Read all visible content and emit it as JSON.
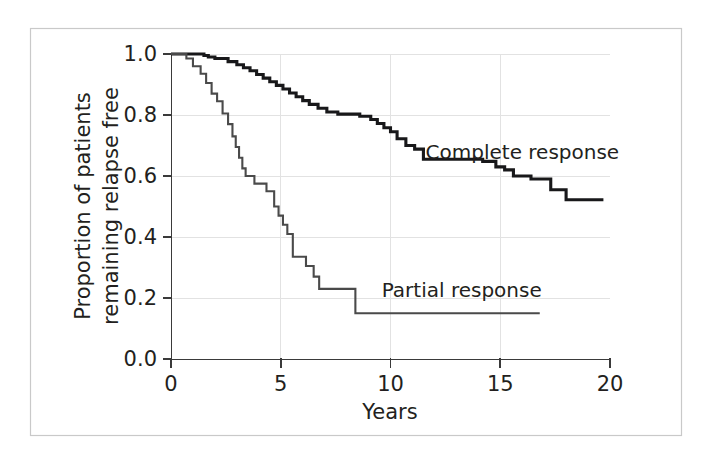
{
  "chart_data": {
    "type": "line",
    "title": "",
    "subtitle": "",
    "xlabel": "Years",
    "ylabel": "Proportion of patients remaining relapse free",
    "ylabel_line1": "Proportion of patients",
    "ylabel_line2": "remaining relapse free",
    "xlim": [
      0,
      20
    ],
    "ylim": [
      0.0,
      1.0
    ],
    "xticks": [
      0,
      5,
      10,
      15,
      20
    ],
    "xticklabels": [
      "0",
      "5",
      "10",
      "15",
      "20"
    ],
    "yticks": [
      0.0,
      0.2,
      0.4,
      0.6,
      0.8,
      1.0
    ],
    "yticklabels": [
      "0.0",
      "0.2",
      "0.4",
      "0.6",
      "0.8",
      "1.0"
    ],
    "grid": true,
    "grid_color": "#e2e2e2",
    "legend_position": "inline-annotations",
    "plot_style": "kaplan-meier step curves",
    "series": [
      {
        "name": "Complete response",
        "label": "Complete response",
        "color": "#18181a",
        "line_width": 3.1,
        "label_x": 11.6,
        "label_y": 0.655,
        "points": [
          [
            0.0,
            1.0
          ],
          [
            1.5,
            1.0
          ],
          [
            1.5,
            0.995
          ],
          [
            1.7,
            0.995
          ],
          [
            1.7,
            0.99
          ],
          [
            2.0,
            0.99
          ],
          [
            2.0,
            0.985
          ],
          [
            2.6,
            0.985
          ],
          [
            2.6,
            0.975
          ],
          [
            3.0,
            0.975
          ],
          [
            3.0,
            0.965
          ],
          [
            3.3,
            0.965
          ],
          [
            3.3,
            0.955
          ],
          [
            3.6,
            0.955
          ],
          [
            3.6,
            0.945
          ],
          [
            3.9,
            0.945
          ],
          [
            3.9,
            0.933
          ],
          [
            4.2,
            0.933
          ],
          [
            4.2,
            0.921
          ],
          [
            4.5,
            0.921
          ],
          [
            4.5,
            0.909
          ],
          [
            4.8,
            0.909
          ],
          [
            4.8,
            0.897
          ],
          [
            5.1,
            0.897
          ],
          [
            5.1,
            0.885
          ],
          [
            5.4,
            0.885
          ],
          [
            5.4,
            0.872
          ],
          [
            5.7,
            0.872
          ],
          [
            5.7,
            0.86
          ],
          [
            6.0,
            0.86
          ],
          [
            6.0,
            0.847
          ],
          [
            6.3,
            0.847
          ],
          [
            6.3,
            0.835
          ],
          [
            6.7,
            0.835
          ],
          [
            6.7,
            0.822
          ],
          [
            7.1,
            0.822
          ],
          [
            7.1,
            0.81
          ],
          [
            7.6,
            0.81
          ],
          [
            7.6,
            0.803
          ],
          [
            8.6,
            0.803
          ],
          [
            8.6,
            0.796
          ],
          [
            9.1,
            0.796
          ],
          [
            9.1,
            0.785
          ],
          [
            9.4,
            0.785
          ],
          [
            9.4,
            0.772
          ],
          [
            9.7,
            0.772
          ],
          [
            9.7,
            0.758
          ],
          [
            10.0,
            0.758
          ],
          [
            10.0,
            0.745
          ],
          [
            10.3,
            0.745
          ],
          [
            10.3,
            0.722
          ],
          [
            10.7,
            0.722
          ],
          [
            10.7,
            0.7
          ],
          [
            11.1,
            0.7
          ],
          [
            11.1,
            0.688
          ],
          [
            11.5,
            0.688
          ],
          [
            11.5,
            0.655
          ],
          [
            14.2,
            0.655
          ],
          [
            14.2,
            0.648
          ],
          [
            14.8,
            0.648
          ],
          [
            14.8,
            0.63
          ],
          [
            15.2,
            0.63
          ],
          [
            15.2,
            0.62
          ],
          [
            15.6,
            0.62
          ],
          [
            15.6,
            0.6
          ],
          [
            16.4,
            0.6
          ],
          [
            16.4,
            0.59
          ],
          [
            17.3,
            0.59
          ],
          [
            17.3,
            0.555
          ],
          [
            18.0,
            0.555
          ],
          [
            18.0,
            0.522
          ],
          [
            19.7,
            0.522
          ]
        ]
      },
      {
        "name": "Partial response",
        "label": "Partial response",
        "color": "#4a4a4a",
        "line_width": 2.1,
        "label_x": 9.6,
        "label_y": 0.205,
        "points": [
          [
            0.0,
            1.0
          ],
          [
            0.7,
            1.0
          ],
          [
            0.7,
            0.985
          ],
          [
            1.0,
            0.985
          ],
          [
            1.0,
            0.96
          ],
          [
            1.35,
            0.96
          ],
          [
            1.35,
            0.935
          ],
          [
            1.6,
            0.935
          ],
          [
            1.6,
            0.905
          ],
          [
            1.85,
            0.905
          ],
          [
            1.85,
            0.87
          ],
          [
            2.1,
            0.87
          ],
          [
            2.1,
            0.845
          ],
          [
            2.35,
            0.845
          ],
          [
            2.35,
            0.805
          ],
          [
            2.6,
            0.805
          ],
          [
            2.6,
            0.77
          ],
          [
            2.8,
            0.77
          ],
          [
            2.8,
            0.73
          ],
          [
            2.95,
            0.73
          ],
          [
            2.95,
            0.695
          ],
          [
            3.1,
            0.695
          ],
          [
            3.1,
            0.66
          ],
          [
            3.25,
            0.66
          ],
          [
            3.25,
            0.625
          ],
          [
            3.4,
            0.625
          ],
          [
            3.4,
            0.6
          ],
          [
            3.8,
            0.6
          ],
          [
            3.8,
            0.575
          ],
          [
            4.35,
            0.575
          ],
          [
            4.35,
            0.55
          ],
          [
            4.7,
            0.55
          ],
          [
            4.7,
            0.5
          ],
          [
            4.9,
            0.5
          ],
          [
            4.9,
            0.47
          ],
          [
            5.1,
            0.47
          ],
          [
            5.1,
            0.44
          ],
          [
            5.3,
            0.44
          ],
          [
            5.3,
            0.41
          ],
          [
            5.55,
            0.41
          ],
          [
            5.55,
            0.335
          ],
          [
            6.15,
            0.335
          ],
          [
            6.15,
            0.305
          ],
          [
            6.5,
            0.305
          ],
          [
            6.5,
            0.27
          ],
          [
            6.75,
            0.27
          ],
          [
            6.75,
            0.23
          ],
          [
            8.4,
            0.23
          ],
          [
            8.4,
            0.15
          ],
          [
            16.8,
            0.15
          ]
        ]
      }
    ]
  },
  "geometry": {
    "plot_x0_px": 171,
    "plot_x_per_year_px": 21.95,
    "plot_y0_px": 359,
    "plot_y_per_unit_px": 305
  }
}
